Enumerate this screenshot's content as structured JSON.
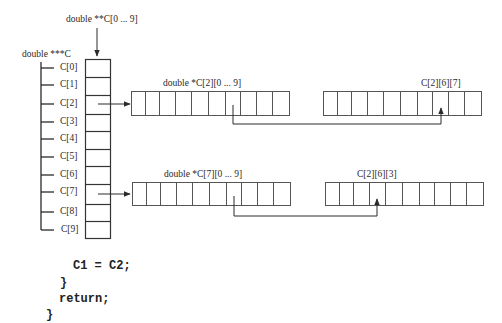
{
  "diagram": {
    "labels": {
      "pointer_array": "double **C[0 ... 9]",
      "triple_pointer": "double ***C",
      "row2_array": "double *C[2][0 ... 9]",
      "row7_array": "double *C[7][0 ... 9]",
      "target_top": "C[2][6][7]",
      "target_bottom": "C[2][6][3]"
    },
    "index_labels": [
      "C[0]",
      "C[1]",
      "C[2]",
      "C[3]",
      "C[4]",
      "C[5]",
      "C[6]",
      "C[7]",
      "C[8]",
      "C[9]"
    ],
    "cells_per_array": 10
  },
  "code": {
    "lines": [
      "C1 = C2;",
      "}",
      "return;",
      "}"
    ]
  },
  "colors": {
    "line": "#2a2a2a",
    "box_border": "#555555",
    "text": "#2a2a2a"
  }
}
